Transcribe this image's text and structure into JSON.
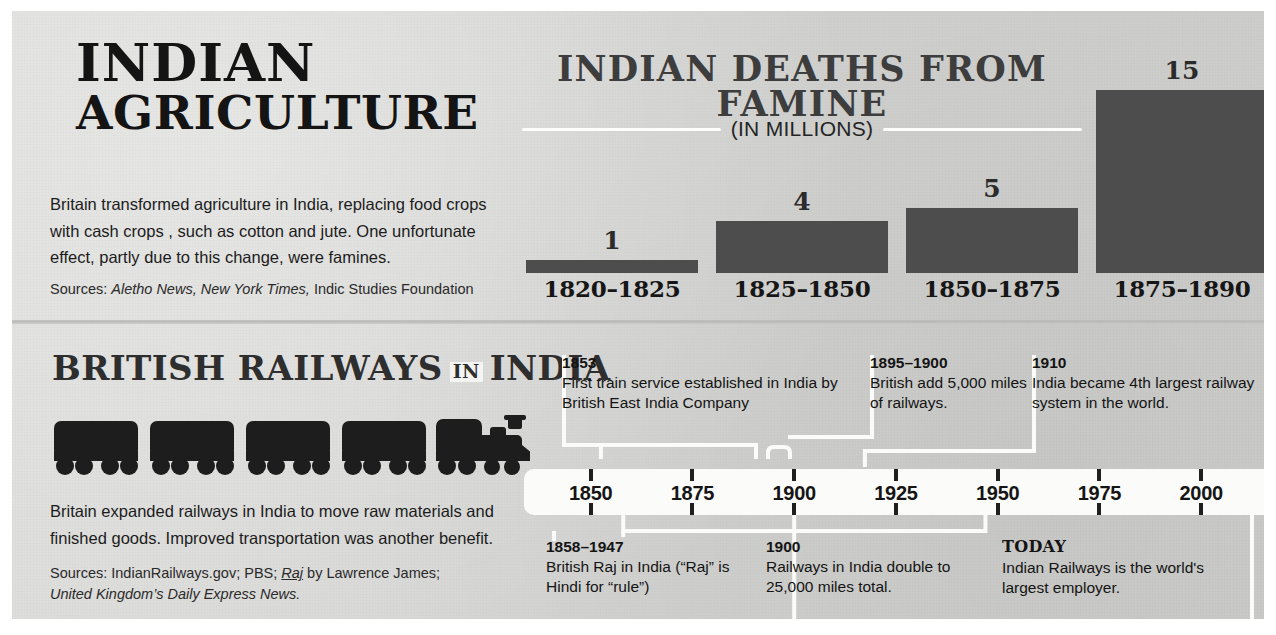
{
  "agriculture": {
    "title_line1": "INDIAN",
    "title_line2": "AGRICULTURE",
    "body": "Britain transformed agriculture in India, replacing food crops with cash crops , such as cotton and jute. One unfortunate effect, partly due to this change, were famines.",
    "sources_prefix": "Sources: ",
    "sources_italic1": "Aletho News, New York Times,",
    "sources_rest": " Indic Studies Foundation"
  },
  "railways": {
    "title_part1": "BRITISH RAILWAYS",
    "title_in": "IN",
    "title_part2": "INDIA",
    "body": "Britain expanded railways in India to move raw materials and finished goods. Improved transportation was another benefit.",
    "sources_prefix": "Sources: IndianRailways.gov; PBS; ",
    "sources_raj": "Raj",
    "sources_mid": " by Lawrence James;",
    "sources_italic_line": "United Kingdom’s Daily Express News.",
    "train_icon": "train-cars-icon"
  },
  "chart_data": {
    "type": "bar",
    "title": "INDIAN DEATHS FROM FAMINE",
    "subtitle": "(IN MILLIONS)",
    "categories": [
      "1820–1825",
      "1825–1850",
      "1850–1875",
      "1875–1890"
    ],
    "values": [
      1,
      4,
      5,
      15
    ],
    "value_labels": [
      "1",
      "4",
      "5",
      "15"
    ],
    "xlabel": "",
    "ylabel": "Deaths (millions)",
    "ylim": [
      0,
      15
    ],
    "grid": false,
    "legend": false,
    "bar_color": "#4d4d4d",
    "background_color": "#d6d6d4"
  },
  "timeline": {
    "ticks": [
      "1850",
      "1875",
      "1900",
      "1925",
      "1950",
      "1975",
      "2000"
    ],
    "range": [
      1840,
      2012
    ],
    "notes_above": [
      {
        "year": "1853",
        "text": "First train service established in India by British East India Company"
      },
      {
        "year": "1895–1900",
        "text": "British add 5,000 miles of railways."
      },
      {
        "year": "1910",
        "text": "India became 4th largest railway system in the world."
      }
    ],
    "notes_below": [
      {
        "year": "1858–1947",
        "text": "British Raj in India (“Raj” is Hindi for “rule”)"
      },
      {
        "year": "1900",
        "text": "Railways in India double to 25,000 miles total."
      },
      {
        "year": "TODAY",
        "text": "Indian Railways is the world's largest employer."
      }
    ]
  }
}
